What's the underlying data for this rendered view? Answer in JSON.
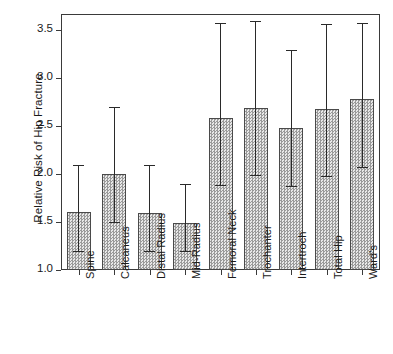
{
  "chart_data": {
    "type": "bar",
    "title": "",
    "xlabel": "",
    "ylabel": "Relative Risk of Hip Fracture",
    "ylim": [
      1.0,
      3.67
    ],
    "yticks": [
      1.0,
      1.5,
      2.0,
      2.5,
      3.0,
      3.5
    ],
    "ytick_labels": [
      "1.0",
      "1.5",
      "2.0",
      "2.5",
      "3.0",
      "3.5"
    ],
    "grid": false,
    "legend": null,
    "baseline": 1.0,
    "error_bars": true,
    "categories": [
      "Spine",
      "Calcaneus",
      "Distal Radius",
      "Mid-Radius",
      "Femoral Neck",
      "Trochanter",
      "Intertroch",
      "Total Hip",
      "Ward's"
    ],
    "values": [
      1.6,
      2.0,
      1.59,
      1.49,
      2.59,
      2.69,
      2.48,
      2.68,
      2.78
    ],
    "ci_low": [
      1.2,
      1.5,
      1.2,
      1.2,
      1.89,
      1.99,
      1.88,
      1.98,
      2.07
    ],
    "ci_high": [
      2.1,
      2.7,
      2.1,
      1.9,
      3.58,
      3.6,
      3.29,
      3.57,
      3.58
    ],
    "bars": [
      {
        "label": "Spine",
        "value": 1.6,
        "ci_low": 1.2,
        "ci_high": 2.1
      },
      {
        "label": "Calcaneus",
        "value": 2.0,
        "ci_low": 1.5,
        "ci_high": 2.7
      },
      {
        "label": "Distal Radius",
        "value": 1.59,
        "ci_low": 1.2,
        "ci_high": 2.1
      },
      {
        "label": "Mid-Radius",
        "value": 1.49,
        "ci_low": 1.2,
        "ci_high": 1.9
      },
      {
        "label": "Femoral Neck",
        "value": 2.59,
        "ci_low": 1.89,
        "ci_high": 3.58
      },
      {
        "label": "Trochanter",
        "value": 2.69,
        "ci_low": 1.99,
        "ci_high": 3.6
      },
      {
        "label": "Intertroch",
        "value": 2.48,
        "ci_low": 1.88,
        "ci_high": 3.29
      },
      {
        "label": "Total Hip",
        "value": 2.68,
        "ci_low": 1.98,
        "ci_high": 3.57
      },
      {
        "label": "Ward's",
        "value": 2.78,
        "ci_low": 2.07,
        "ci_high": 3.58
      }
    ]
  },
  "colors": {
    "bar_fill": "#d8d8d8",
    "bar_edge": "#4a4a4a",
    "error_bar": "#2a2a2a",
    "axis": "#3a3a3a",
    "text": "#1a1a1a",
    "background": "#ffffff"
  }
}
